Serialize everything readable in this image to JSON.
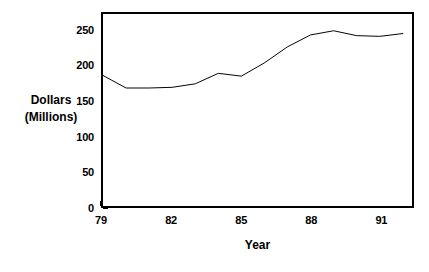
{
  "chart_data": {
    "type": "line",
    "title": "",
    "xlabel": "Year",
    "ylabel": "Dollars (Millions)",
    "ylabel_line1": "Dollars",
    "ylabel_line2": "(Millions)",
    "x": [
      79,
      80,
      81,
      82,
      83,
      84,
      85,
      86,
      87,
      88,
      89,
      90,
      91,
      92
    ],
    "values": [
      187,
      169,
      169,
      170,
      175,
      190,
      186,
      205,
      228,
      245,
      251,
      244,
      243,
      247
    ],
    "series": [
      {
        "name": "Dollars (Millions)",
        "values": [
          187,
          169,
          169,
          170,
          175,
          190,
          186,
          205,
          228,
          245,
          251,
          244,
          243,
          247
        ]
      }
    ],
    "xlim": [
      79,
      92.4
    ],
    "ylim": [
      0,
      275
    ],
    "xticks": [
      79,
      82,
      85,
      88,
      91
    ],
    "xticklabels": [
      "79",
      "82",
      "85",
      "88",
      "91"
    ],
    "yticks": [
      0,
      50,
      100,
      150,
      200,
      250
    ],
    "yticklabels": [
      "0",
      "50",
      "100",
      "150",
      "200",
      "250"
    ],
    "grid": false,
    "legend": false,
    "legend_position": "none",
    "line_color": "#000000",
    "background_color": "#ffffff",
    "axis_color": "#000000"
  }
}
